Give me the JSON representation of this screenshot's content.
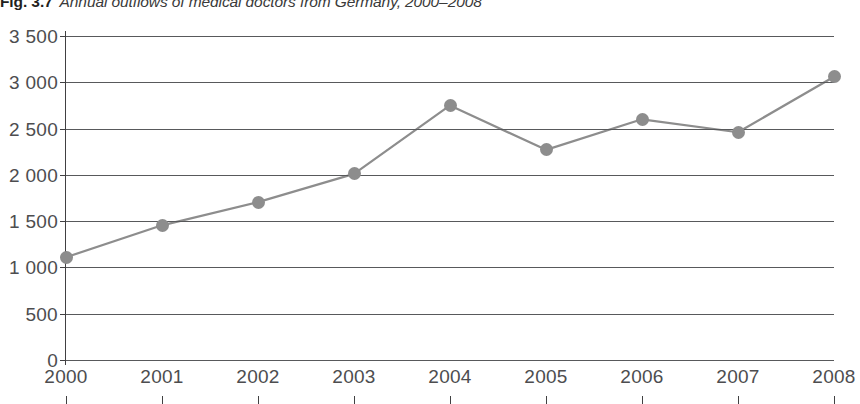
{
  "figure": {
    "label": "Fig. 3.7",
    "caption": "Annual outflows of medical doctors from Germany, 2000–2008"
  },
  "colors": {
    "series": "#8d8d8d",
    "gridline": "#58595b",
    "axis": "#414042",
    "tick_label": "#4d4d4f",
    "background": "#ffffff"
  },
  "chart_data": {
    "type": "line",
    "title": "Annual outflows of medical doctors from Germany, 2000–2008",
    "xlabel": "",
    "ylabel": "",
    "categories": [
      "2000",
      "2001",
      "2002",
      "2003",
      "2004",
      "2005",
      "2006",
      "2007",
      "2008"
    ],
    "x": [
      2000,
      2001,
      2002,
      2003,
      2004,
      2005,
      2006,
      2007,
      2008
    ],
    "values": [
      1110,
      1455,
      1705,
      2010,
      2750,
      2270,
      2600,
      2460,
      3060
    ],
    "series": [
      {
        "name": "Annual outflows of medical doctors",
        "values": [
          1110,
          1455,
          1705,
          2010,
          2750,
          2270,
          2600,
          2460,
          3060
        ]
      }
    ],
    "ylim": [
      0,
      3500
    ],
    "ytick_values": [
      0,
      500,
      1000,
      1500,
      2000,
      2500,
      3000,
      3500
    ],
    "ytick_labels": [
      "0",
      "500",
      "1 000",
      "1 500",
      "2 000",
      "2 500",
      "3 000",
      "3 500"
    ],
    "xtick_labels": [
      "2000",
      "2001",
      "2002",
      "2003",
      "2004",
      "2005",
      "2006",
      "2007",
      "2008"
    ],
    "grid": true,
    "grid_axis": "y",
    "legend": false,
    "legend_position": "none",
    "markers": "circle",
    "annotations": []
  }
}
